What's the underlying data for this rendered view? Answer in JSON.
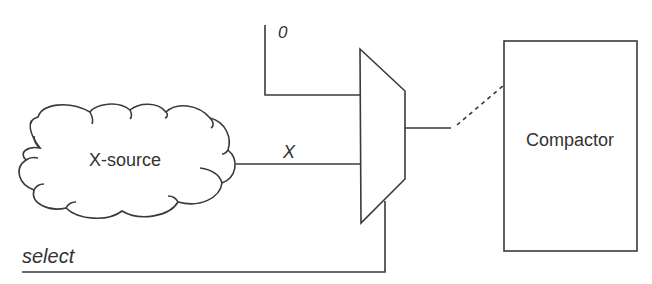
{
  "diagram": {
    "source": {
      "label": "X-source",
      "shape": "cloud"
    },
    "signals": {
      "zero_input": "0",
      "x_input": "X",
      "select": "select"
    },
    "mux": {
      "shape": "trapezoid",
      "inputs": 2,
      "role": "multiplexer"
    },
    "compactor": {
      "label": "Compactor",
      "shape": "rectangle"
    },
    "connections": [
      {
        "from": "constant-0",
        "to": "mux-input-top"
      },
      {
        "from": "X-source",
        "to": "mux-input-bottom",
        "label": "X"
      },
      {
        "from": "select",
        "to": "mux-select"
      },
      {
        "from": "mux-output",
        "to": "Compactor",
        "style": "dashed"
      }
    ],
    "colors": {
      "stroke": "#3a3a3a",
      "text": "#333333",
      "background": "#ffffff"
    }
  }
}
